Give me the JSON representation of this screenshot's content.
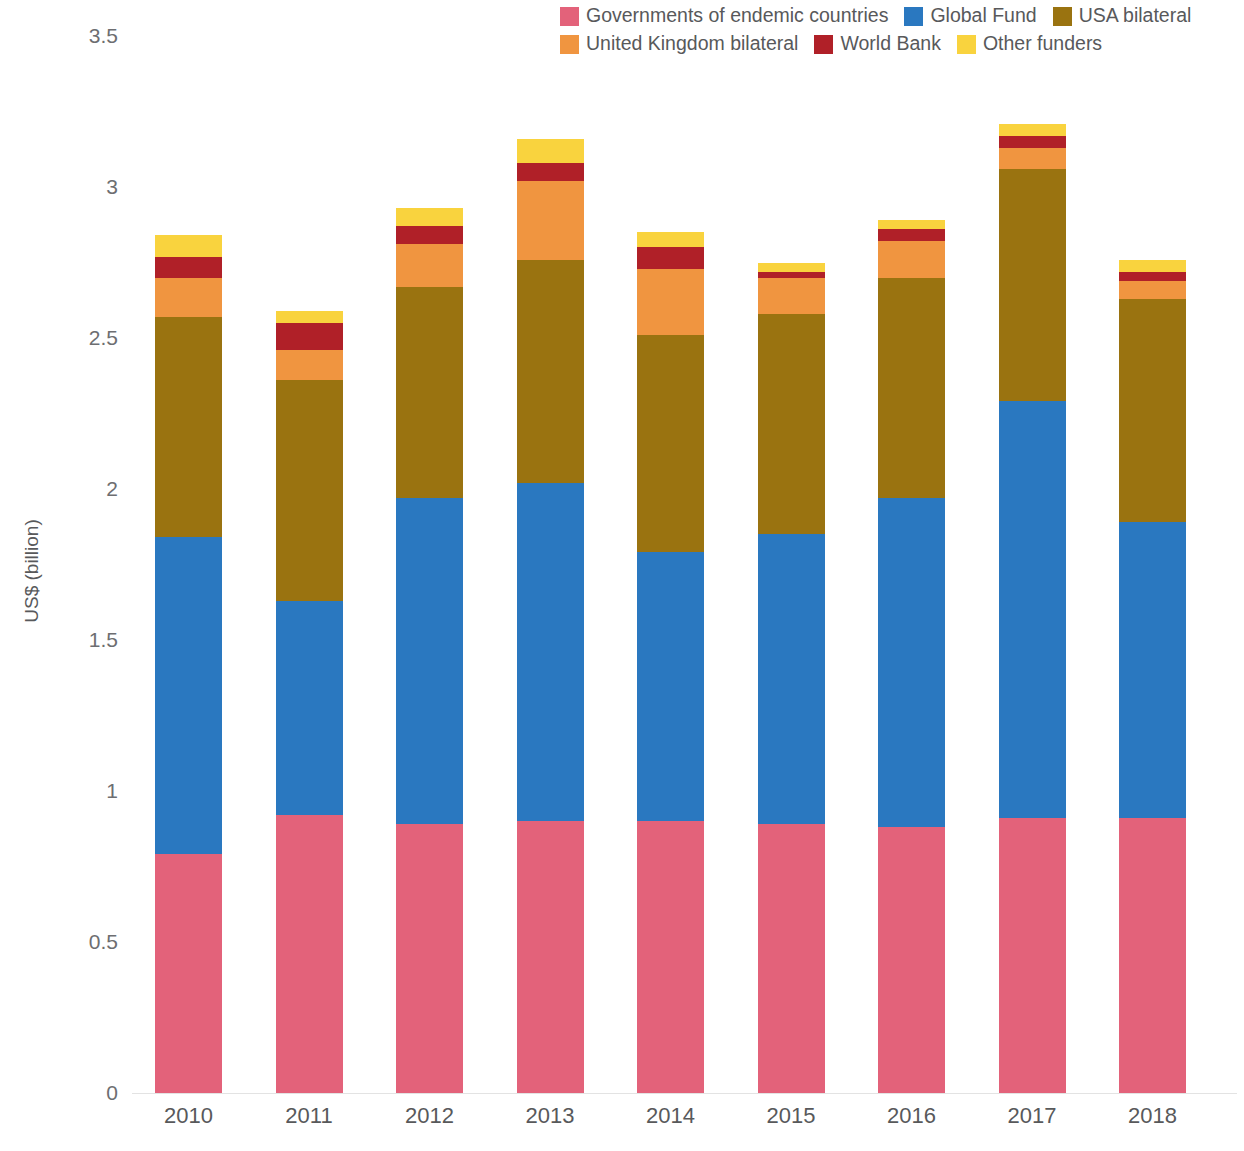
{
  "chart_data": {
    "type": "bar",
    "subtype": "stacked-vertical",
    "title": "",
    "xlabel": "",
    "ylabel": "US$ (billion)",
    "ylim": [
      0,
      3.5
    ],
    "yticks": [
      "0",
      "0.5",
      "1",
      "1.5",
      "2",
      "2.5",
      "3",
      "3.5"
    ],
    "ytick_values": [
      0,
      0.5,
      1,
      1.5,
      2,
      2.5,
      3,
      3.5
    ],
    "grid": false,
    "legend_position": "top-right",
    "categories": [
      "2010",
      "2011",
      "2012",
      "2013",
      "2014",
      "2015",
      "2016",
      "2017",
      "2018"
    ],
    "series": [
      {
        "name": "Governments of endemic countries",
        "color": "#E3627A",
        "values": [
          0.79,
          0.92,
          0.89,
          0.9,
          0.9,
          0.89,
          0.88,
          0.91,
          0.91
        ]
      },
      {
        "name": "Global Fund",
        "color": "#2A78C0",
        "values": [
          1.05,
          0.71,
          1.08,
          1.12,
          0.89,
          0.96,
          1.09,
          1.38,
          0.98
        ]
      },
      {
        "name": "USA bilateral",
        "color": "#9A7310",
        "values": [
          0.73,
          0.73,
          0.7,
          0.74,
          0.72,
          0.73,
          0.73,
          0.77,
          0.74
        ]
      },
      {
        "name": "United Kingdom bilateral",
        "color": "#F09540",
        "values": [
          0.13,
          0.1,
          0.14,
          0.26,
          0.22,
          0.12,
          0.12,
          0.07,
          0.06
        ]
      },
      {
        "name": "World Bank",
        "color": "#B02028",
        "values": [
          0.07,
          0.09,
          0.06,
          0.06,
          0.07,
          0.02,
          0.04,
          0.04,
          0.03
        ]
      },
      {
        "name": "Other funders",
        "color": "#F9D33E",
        "values": [
          0.07,
          0.04,
          0.06,
          0.08,
          0.05,
          0.03,
          0.03,
          0.04,
          0.04
        ]
      }
    ],
    "totals": [
      2.84,
      2.59,
      2.93,
      3.16,
      2.85,
      2.75,
      2.89,
      3.21,
      2.76
    ]
  },
  "legend": {
    "rows": [
      [
        {
          "label": "Governments of endemic countries",
          "color": "#E3627A"
        },
        {
          "label": "Global Fund",
          "color": "#2A78C0"
        },
        {
          "label": "USA bilateral",
          "color": "#9A7310"
        }
      ],
      [
        {
          "label": "United Kingdom bilateral",
          "color": "#F09540"
        },
        {
          "label": "World Bank",
          "color": "#B02028"
        },
        {
          "label": "Other funders",
          "color": "#F9D33E"
        }
      ]
    ]
  }
}
